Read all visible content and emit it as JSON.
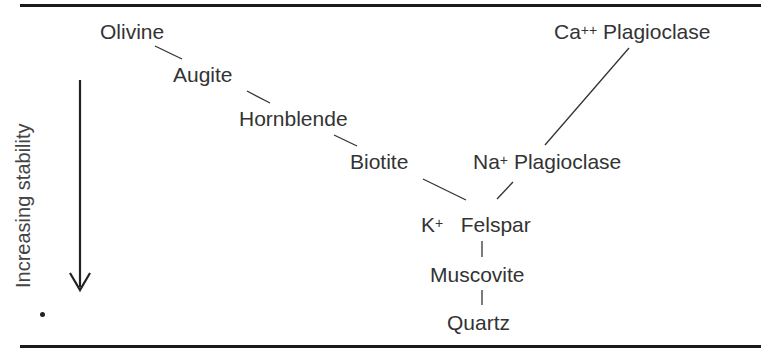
{
  "diagram": {
    "axis": {
      "label": "Increasing stability",
      "direction": "down"
    },
    "discontinuous_series": [
      {
        "name": "Olivine"
      },
      {
        "name": "Augite"
      },
      {
        "name": "Hornblende"
      },
      {
        "name": "Biotite"
      }
    ],
    "continuous_series": [
      {
        "ion": "Ca",
        "charge": "++",
        "name": "Plagioclase"
      },
      {
        "ion": "Na",
        "charge": "+",
        "name": "Plagioclase"
      }
    ],
    "convergent": [
      {
        "ion": "K",
        "charge": "+",
        "name": "Felspar"
      },
      {
        "name": "Muscovite"
      },
      {
        "name": "Quartz"
      }
    ],
    "colors": {
      "ink": "#333333",
      "rule": "#1a1a1a",
      "background": "#ffffff"
    }
  }
}
